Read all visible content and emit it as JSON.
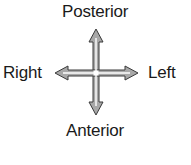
{
  "diagram": {
    "labels": {
      "top": "Posterior",
      "bottom": "Anterior",
      "left": "Right",
      "right": "Left"
    },
    "arrows": {
      "fill_color": "#a8a8a8",
      "stroke_color": "#3a3a3a",
      "center_line_color": "#ffffff"
    }
  }
}
